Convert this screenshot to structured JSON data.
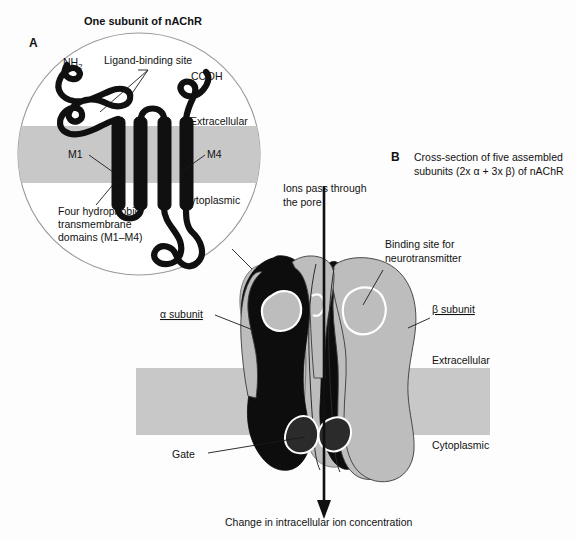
{
  "figure": {
    "background_color": "#fdfdfd",
    "membrane_color": "#c8c8c8",
    "alpha_color": "#0d0d0d",
    "beta_color": "#bdbdbd"
  },
  "panel_a": {
    "letter": "A",
    "title": "One subunit of nAChR",
    "labels": {
      "n_terminus": "NH",
      "n_terminus_sub": "2",
      "c_terminus": "COOH",
      "ligand_binding_site": "Ligand-binding site",
      "extracellular": "Extracellular",
      "cytoplasmic": "Cytoplasmic",
      "m1": "M1",
      "m4": "M4",
      "transmembrane_line1": "Four hydrophobic",
      "transmembrane_line2": "transmembrane",
      "transmembrane_line3": "domains (M1–M4)"
    }
  },
  "panel_b": {
    "letter": "B",
    "title_line1": "Cross-section of five assembled",
    "title_line2": "subunits (2x α + 3x β) of nAChR",
    "labels": {
      "ions_line1": "Ions pass through",
      "ions_line2": "the pore",
      "binding_site_line1": "Binding site for",
      "binding_site_line2": "neurotransmitter",
      "alpha_subunit": "α subunit",
      "beta_subunit": "β subunit",
      "extracellular": "Extracellular",
      "cytoplasmic": "Cytoplasmic",
      "gate": "Gate",
      "bottom_caption": "Change in intracellular ion concentration"
    }
  }
}
